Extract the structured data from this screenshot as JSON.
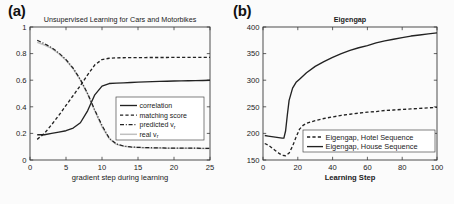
{
  "figure": {
    "panel_a_label": "(a)",
    "panel_b_label": "(b)"
  },
  "chart_data": [
    {
      "id": "panel_a",
      "type": "line",
      "title": "Unsupervised Learning for Cars and Motorbikes",
      "xlabel": "gradient step during learning",
      "ylabel": "",
      "xlim": [
        0,
        25
      ],
      "ylim": [
        0,
        1
      ],
      "xticks": [
        0,
        5,
        10,
        15,
        20,
        25
      ],
      "xtick_labels": [
        "0",
        "5",
        "10",
        "15",
        "20",
        "25"
      ],
      "yticks": [
        0,
        0.2,
        0.4,
        0.6,
        0.8,
        1
      ],
      "ytick_labels": [
        "0",
        "0.2",
        "0.4",
        "0.6",
        "0.8",
        "1"
      ],
      "grid": false,
      "legend_position": "center-right",
      "series": [
        {
          "name": "correlation",
          "style": "solid",
          "color": "#222222",
          "x": [
            1,
            2,
            3,
            4,
            5,
            6,
            7,
            8,
            9,
            10,
            11,
            12,
            13,
            14,
            15,
            16,
            17,
            18,
            19,
            20,
            21,
            22,
            23,
            24,
            25
          ],
          "values": [
            0.19,
            0.19,
            0.2,
            0.21,
            0.22,
            0.24,
            0.28,
            0.37,
            0.49,
            0.555,
            0.575,
            0.578,
            0.58,
            0.583,
            0.585,
            0.587,
            0.589,
            0.591,
            0.592,
            0.594,
            0.595,
            0.596,
            0.597,
            0.598,
            0.6
          ]
        },
        {
          "name": "matching score",
          "style": "dashed",
          "color": "#222222",
          "x": [
            1,
            2,
            3,
            4,
            5,
            6,
            7,
            8,
            9,
            10,
            11,
            12,
            13,
            14,
            15,
            16,
            17,
            18,
            19,
            20,
            21,
            22,
            23,
            24,
            25
          ],
          "values": [
            0.155,
            0.2,
            0.265,
            0.335,
            0.41,
            0.485,
            0.56,
            0.64,
            0.715,
            0.755,
            0.765,
            0.768,
            0.769,
            0.77,
            0.77,
            0.77,
            0.771,
            0.771,
            0.771,
            0.772,
            0.772,
            0.772,
            0.772,
            0.772,
            0.772
          ]
        },
        {
          "name": "predicted v_r",
          "style": "dashdot",
          "color": "#222222",
          "x": [
            1,
            2,
            3,
            4,
            5,
            6,
            7,
            8,
            9,
            10,
            11,
            12,
            13,
            14,
            15,
            16,
            17,
            18,
            19,
            20,
            21,
            22,
            23,
            24,
            25
          ],
          "values": [
            0.9,
            0.875,
            0.845,
            0.805,
            0.755,
            0.69,
            0.605,
            0.5,
            0.375,
            0.26,
            0.165,
            0.12,
            0.105,
            0.098,
            0.095,
            0.093,
            0.092,
            0.091,
            0.09,
            0.09,
            0.089,
            0.089,
            0.089,
            0.088,
            0.088
          ]
        },
        {
          "name": "real v_r",
          "style": "solid-light",
          "color": "#c0c0c0",
          "x": [
            1,
            2,
            3,
            4,
            5,
            6,
            7,
            8,
            9,
            10,
            11,
            12,
            13,
            14,
            15,
            16,
            17,
            18,
            19,
            20,
            21,
            22,
            23,
            24,
            25
          ],
          "values": [
            0.885,
            0.865,
            0.84,
            0.8,
            0.75,
            0.685,
            0.6,
            0.495,
            0.37,
            0.25,
            0.16,
            0.118,
            0.104,
            0.097,
            0.094,
            0.092,
            0.091,
            0.09,
            0.089,
            0.089,
            0.088,
            0.088,
            0.088,
            0.087,
            0.087
          ]
        }
      ],
      "legend": [
        {
          "label": "correlation",
          "style": "solid",
          "color": "#222222"
        },
        {
          "label": "matching score",
          "style": "dashed",
          "color": "#222222"
        },
        {
          "label": "predicted v",
          "sub": "r",
          "style": "dashdot",
          "color": "#222222"
        },
        {
          "label": "real v",
          "sub": "r",
          "style": "solid-light",
          "color": "#c0c0c0"
        }
      ]
    },
    {
      "id": "panel_b",
      "type": "line",
      "title": "Eigengap",
      "xlabel": "Learning Step",
      "ylabel": "",
      "xlim": [
        0,
        100
      ],
      "ylim": [
        150,
        400
      ],
      "xticks": [
        0,
        20,
        40,
        60,
        80,
        100
      ],
      "xtick_labels": [
        "0",
        "20",
        "40",
        "60",
        "80",
        "100"
      ],
      "yticks": [
        150,
        200,
        250,
        300,
        350,
        400
      ],
      "ytick_labels": [
        "150",
        "200",
        "250",
        "300",
        "350",
        "400"
      ],
      "grid": false,
      "legend_position": "bottom-right",
      "series": [
        {
          "name": "Eigengap, Hotel Sequence",
          "style": "dashed",
          "color": "#222222",
          "x": [
            1,
            3,
            5,
            7,
            9,
            11,
            13,
            15,
            17,
            19,
            21,
            23,
            25,
            30,
            35,
            40,
            45,
            50,
            55,
            60,
            65,
            70,
            75,
            80,
            85,
            90,
            95,
            100
          ],
          "values": [
            181,
            178,
            173,
            168,
            163,
            159,
            158,
            163,
            176,
            193,
            208,
            215,
            219,
            224,
            228,
            231,
            234,
            236,
            238,
            240,
            241,
            243,
            244,
            245,
            246,
            247,
            248,
            249
          ]
        },
        {
          "name": "Eigengap, House Sequence",
          "style": "solid",
          "color": "#222222",
          "x": [
            1,
            3,
            5,
            7,
            9,
            11,
            12,
            13,
            14,
            15,
            17,
            19,
            21,
            23,
            25,
            30,
            35,
            40,
            45,
            50,
            55,
            60,
            65,
            70,
            75,
            80,
            85,
            90,
            95,
            100
          ],
          "values": [
            196,
            195,
            194,
            193,
            192,
            191,
            191,
            205,
            235,
            262,
            285,
            296,
            302,
            308,
            314,
            326,
            335,
            343,
            350,
            356,
            361,
            365,
            370,
            374,
            377,
            380,
            383,
            385,
            387,
            389
          ]
        }
      ],
      "legend": [
        {
          "label": "Eigengap, Hotel Sequence",
          "style": "dashed",
          "color": "#222222"
        },
        {
          "label": "Eigengap, House Sequence",
          "style": "solid",
          "color": "#222222"
        }
      ]
    }
  ]
}
